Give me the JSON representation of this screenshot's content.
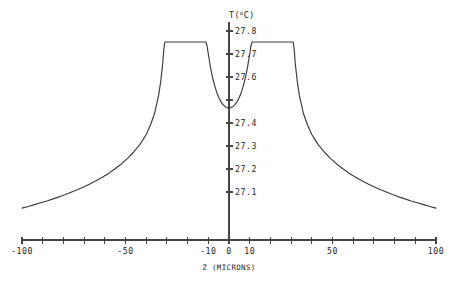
{
  "chart_data": {
    "type": "line",
    "title": "",
    "xlabel": "Z (MICRONS)",
    "ylabel": "T(°C)",
    "ylabel_main": "T(",
    "ylabel_sup": "o",
    "ylabel_tail": "C)",
    "xlim": [
      -100,
      100
    ],
    "ylim": [
      27.03,
      27.83
    ],
    "grid": false,
    "legend": null,
    "x_tick_labels": [
      "-100",
      "-50",
      "-10",
      "0",
      "10",
      "50",
      "100"
    ],
    "x_tick_label_values": [
      -100,
      -50,
      -10,
      0,
      10,
      50,
      100
    ],
    "x_minor_ticks": [
      -100,
      -90,
      -80,
      -70,
      -60,
      -50,
      -40,
      -30,
      -20,
      -10,
      0,
      10,
      20,
      30,
      40,
      50,
      60,
      70,
      80,
      90,
      100
    ],
    "y_tick_labels": [
      "27.8",
      "27.7",
      "27.6",
      "27.4",
      "27.3",
      "27.2",
      "27.1"
    ],
    "y_tick_label_values": [
      27.8,
      27.7,
      27.6,
      27.4,
      27.3,
      27.2,
      27.1
    ],
    "y_minor_ticks": [
      27.8,
      27.7,
      27.6,
      27.5,
      27.4,
      27.3,
      27.2,
      27.1
    ],
    "y_hidden_tick_label": "27.5",
    "plateau_value": 27.752,
    "plateau_left_range": [
      -31,
      -11
    ],
    "plateau_right_range": [
      11,
      31
    ],
    "center_minimum_value": 27.465,
    "center_minimum_x": 0,
    "tail_end_value": 27.03,
    "colors": {
      "curve": "#3a3a3a",
      "axis": "#444444",
      "text": "#262626",
      "background": "#ffffff"
    },
    "x": [
      -100,
      -97,
      -94,
      -91,
      -88,
      -85,
      -82,
      -79,
      -76,
      -73,
      -70,
      -67,
      -64,
      -61,
      -58,
      -55,
      -52,
      -49,
      -46,
      -43,
      -40,
      -38,
      -36,
      -34,
      -33,
      -32,
      -31.5,
      -31,
      -28,
      -25,
      -22,
      -19,
      -16,
      -13,
      -11.5,
      -11,
      -10.5,
      -10,
      -9,
      -8,
      -7,
      -6,
      -5,
      -4,
      -3,
      -2,
      -1,
      0,
      1,
      2,
      3,
      4,
      5,
      6,
      7,
      8,
      9,
      10,
      10.5,
      11,
      11.5,
      13,
      16,
      19,
      22,
      25,
      28,
      31,
      31.5,
      32,
      33,
      34,
      36,
      38,
      40,
      43,
      46,
      49,
      52,
      55,
      58,
      61,
      64,
      67,
      70,
      73,
      76,
      79,
      82,
      85,
      88,
      91,
      94,
      97,
      100
    ],
    "y": [
      27.03,
      27.037,
      27.045,
      27.053,
      27.061,
      27.07,
      27.079,
      27.089,
      27.1,
      27.111,
      27.123,
      27.136,
      27.15,
      27.165,
      27.182,
      27.201,
      27.222,
      27.246,
      27.274,
      27.307,
      27.35,
      27.39,
      27.44,
      27.52,
      27.58,
      27.66,
      27.72,
      27.752,
      27.752,
      27.752,
      27.752,
      27.752,
      27.752,
      27.752,
      27.752,
      27.75,
      27.73,
      27.7,
      27.645,
      27.6,
      27.565,
      27.535,
      27.512,
      27.494,
      27.481,
      27.472,
      27.467,
      27.465,
      27.467,
      27.472,
      27.481,
      27.494,
      27.512,
      27.535,
      27.565,
      27.6,
      27.645,
      27.7,
      27.73,
      27.75,
      27.752,
      27.752,
      27.752,
      27.752,
      27.752,
      27.752,
      27.752,
      27.752,
      27.72,
      27.66,
      27.58,
      27.52,
      27.44,
      27.39,
      27.35,
      27.307,
      27.274,
      27.246,
      27.222,
      27.201,
      27.182,
      27.165,
      27.15,
      27.136,
      27.123,
      27.111,
      27.1,
      27.089,
      27.079,
      27.07,
      27.061,
      27.053,
      27.045,
      27.037,
      27.03
    ]
  }
}
